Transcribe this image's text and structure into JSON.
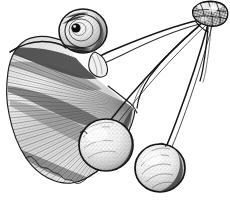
{
  "artwork": {
    "title": "Ginkgo biloba branch with leaf and seeds",
    "medium": "pen and ink line engraving",
    "subject": "ginkgo-branch",
    "background_color": "#ffffff",
    "ink_color": "#1a1a1a",
    "mid_tone_color": "#6f6f6f",
    "light_tone_color": "#b8b8b8",
    "canvas": {
      "width": 230,
      "height": 204
    }
  },
  "elements": {
    "leaf": {
      "name": "ginkgo-leaf",
      "shape": "fan-shaped bilobed leaf",
      "position": "left",
      "vein_pattern": "dichotomous radiating veins",
      "vein_count": 46,
      "margin": "wavy scalloped lower edge",
      "apex_notch": true
    },
    "seeds": [
      {
        "name": "seed-upper-left",
        "cx": 83,
        "cy": 31,
        "rx": 24,
        "ry": 22,
        "hilum": true,
        "hilum_cx": 76,
        "hilum_cy": 28,
        "hilum_r": 4,
        "shading": "ring-hatched with dark central spot"
      },
      {
        "name": "seed-lower-center",
        "cx": 106,
        "cy": 145,
        "rx": 27,
        "ry": 26,
        "hilum": false,
        "shading": "highlight upper-left, dark crescent lower-right"
      },
      {
        "name": "seed-lower-right",
        "cx": 160,
        "cy": 168,
        "rx": 25,
        "ry": 24,
        "hilum": false,
        "shading": "stippled with curved contour lines"
      }
    ],
    "node": {
      "name": "branch-node",
      "cx": 210,
      "cy": 14,
      "description": "gnarled woody node where stalks converge",
      "texture": "cross-hatched knotty bark"
    },
    "stalks": [
      {
        "name": "stalk-to-upper-seed",
        "from": "node",
        "to": "seed-upper-left"
      },
      {
        "name": "stalk-to-lower-center-seed",
        "from": "node",
        "to": "seed-lower-center"
      },
      {
        "name": "stalk-to-lower-right-seed",
        "from": "node",
        "to": "seed-lower-right"
      },
      {
        "name": "stalk-to-leaf-petiole",
        "from": "node",
        "to": "leaf"
      },
      {
        "name": "stalk-stub",
        "from": "node",
        "to": "free end"
      }
    ]
  },
  "caption": {
    "visible": false,
    "text": ""
  }
}
